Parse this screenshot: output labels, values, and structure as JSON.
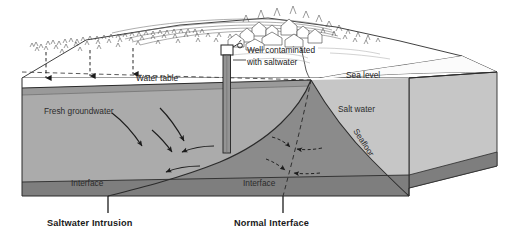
{
  "figure": {
    "type": "block-diagram",
    "labels": {
      "water_table": "Water table",
      "sea_level": "Sea level",
      "fresh_groundwater": "Fresh groundwater",
      "salt_water": "Salt water",
      "seafloor": "Seafloor",
      "well_line1": "Well contaminated",
      "well_line2": "with saltwater",
      "interface_left": "Interface",
      "interface_right": "Interface",
      "caption_left": "Saltwater Intrusion",
      "caption_right": "Normal Interface"
    },
    "icons": {
      "well": "well-head-icon",
      "recharge": "downward-recharge-arrow-icon",
      "flow": "curved-flow-arrow-icon",
      "normal_flow": "dashed-flow-arrow-icon",
      "trees": "tree-cluster-icon",
      "houses": "village-houses-icon"
    },
    "colors": {
      "fresh_zone": "#a9a9a9",
      "salt_wedge": "#8a8a8a",
      "ocean_body": "#c3c3c3",
      "top_surface": "#ffffff",
      "basement": "#7d7d7d",
      "band_under_water_table": "#9b9b9b",
      "outline": "#262626",
      "well_casing": "#8f8f8f"
    },
    "counts": {
      "recharge_arrows": 3,
      "intrusion_flow_arrows": 5,
      "normal_flow_arrows": 4
    }
  }
}
